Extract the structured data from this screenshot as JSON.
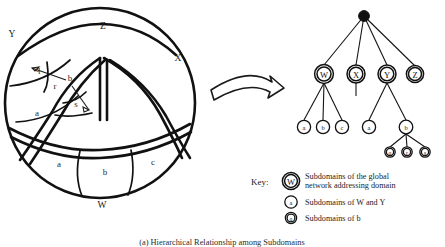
{
  "figure": {
    "caption": "(a) Hierarchical Relationship among Subdomains",
    "transform_arrow": "curved-right-arrow"
  },
  "venn": {
    "outer_labels": [
      {
        "id": "Z",
        "text": "Z",
        "x": 103,
        "y": 29
      },
      {
        "id": "Y",
        "text": "Y",
        "x": 12,
        "y": 37
      },
      {
        "id": "X",
        "text": "X",
        "x": 178,
        "y": 61
      },
      {
        "id": "W",
        "text": "W",
        "x": 102,
        "y": 208
      }
    ],
    "inner_labels": [
      {
        "id": "Y-q",
        "text": "q",
        "x": 38,
        "y": 72
      },
      {
        "id": "Y-r",
        "text": "r",
        "x": 55,
        "y": 89
      },
      {
        "id": "Y-s",
        "text": "s",
        "x": 76,
        "y": 107
      },
      {
        "id": "Y-a",
        "text": "a",
        "x": 37,
        "y": 116
      },
      {
        "id": "Y-b-pointer",
        "text": "b",
        "x": 70,
        "y": 81
      },
      {
        "id": "W-a",
        "text": "a",
        "x": 59,
        "y": 167
      },
      {
        "id": "W-b",
        "text": "b",
        "x": 105,
        "y": 175
      },
      {
        "id": "W-c",
        "text": "c",
        "x": 153,
        "y": 165
      }
    ]
  },
  "tree": {
    "root": {
      "id": "root",
      "label": "",
      "x": 364,
      "y": 16,
      "r": 5.4,
      "filled": true
    },
    "level2": [
      {
        "id": "W",
        "label": "W",
        "x": 324,
        "y": 74,
        "r": 9.4
      },
      {
        "id": "X",
        "label": "X",
        "x": 356,
        "y": 74,
        "r": 9.0
      },
      {
        "id": "Y",
        "label": "Y",
        "x": 387,
        "y": 74,
        "r": 9.0
      },
      {
        "id": "Z",
        "label": "Z",
        "x": 415,
        "y": 74,
        "r": 8.6
      }
    ],
    "level3": [
      {
        "id": "Wa",
        "label": "a",
        "x": 304,
        "y": 127,
        "r": 6.6,
        "parent": "W"
      },
      {
        "id": "Wb",
        "label": "b",
        "x": 323,
        "y": 127,
        "r": 6.6,
        "parent": "W"
      },
      {
        "id": "Wc",
        "label": "c",
        "x": 342,
        "y": 127,
        "r": 6.6,
        "parent": "W"
      },
      {
        "id": "Ya",
        "label": "a",
        "x": 369,
        "y": 127,
        "r": 6.6,
        "parent": "Y"
      },
      {
        "id": "Yb",
        "label": "b",
        "x": 406,
        "y": 127,
        "r": 6.8,
        "parent": "Y"
      }
    ],
    "level4": [
      {
        "id": "q",
        "label": "q",
        "x": 390,
        "y": 152,
        "r": 5.2,
        "parent": "Yb"
      },
      {
        "id": "r",
        "label": "r",
        "x": 407,
        "y": 152,
        "r": 5.2,
        "parent": "Yb"
      },
      {
        "id": "s",
        "label": "s",
        "x": 425,
        "y": 152,
        "r": 5.2,
        "parent": "Yb"
      }
    ],
    "x_stub": {
      "from_x": 356,
      "from_y": 83,
      "to_x": 356,
      "to_y": 96
    }
  },
  "key": {
    "title": "Key:",
    "entries": [
      {
        "symbol": "W",
        "style": "double-ring-large",
        "line1": "Subdomains of the global",
        "line2": "network addressing domain"
      },
      {
        "symbol": "a",
        "style": "single-ring-small",
        "line1": "Subdomains of W and Y",
        "line2": ""
      },
      {
        "symbol": "q",
        "style": "double-ring-small",
        "line1": "Subdomains of b",
        "line2": ""
      }
    ]
  },
  "colors": {
    "ink": "#111111",
    "background": "#ffffff"
  }
}
